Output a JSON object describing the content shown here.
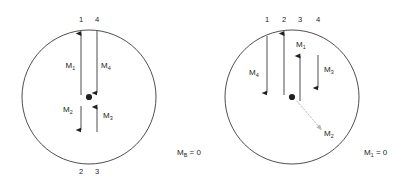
{
  "figure": {
    "background_color": "#ffffff",
    "stroke_color": "#231f20",
    "dim_stroke_color": "#b5b5b5",
    "diagrams": [
      {
        "id": "left-diagram",
        "name": "left-circle-diagram",
        "center": {
          "x": 89,
          "y": 97
        },
        "radius": 67,
        "top_node_numbers": [
          "1",
          "4"
        ],
        "bottom_node_numbers": [
          "2",
          "3"
        ],
        "caption": {
          "symbol": "M",
          "subscript": "B",
          "equals": " = 0",
          "full": "Mʙ = 0"
        },
        "moments": [
          {
            "label": "M",
            "subscript": "1",
            "direction": "up",
            "style": "solid"
          },
          {
            "label": "M",
            "subscript": "4",
            "direction": "down",
            "style": "solid"
          },
          {
            "label": "M",
            "subscript": "2",
            "direction": "down",
            "style": "solid"
          },
          {
            "label": "M",
            "subscript": "3",
            "direction": "up",
            "style": "solid"
          }
        ]
      },
      {
        "id": "right-diagram",
        "name": "right-circle-diagram",
        "center": {
          "x": 292,
          "y": 97
        },
        "radius": 67,
        "top_node_numbers": [
          "1",
          "2",
          "3",
          "4"
        ],
        "bottom_node_numbers": [],
        "caption": {
          "symbol": "M",
          "subscript": "1",
          "equals": " = 0",
          "full": "M₁ = 0"
        },
        "moments": [
          {
            "label": "M",
            "subscript": "4",
            "direction": "down",
            "style": "solid"
          },
          {
            "label": "M",
            "subscript": "1",
            "direction": "up",
            "style": "solid"
          },
          {
            "label": "M",
            "subscript": "3",
            "direction": "down",
            "style": "solid"
          },
          {
            "label": "M",
            "subscript": "2",
            "direction": "diagonal-down-right",
            "style": "dotted"
          }
        ]
      }
    ]
  },
  "left": {
    "num_1": "1",
    "num_4": "4",
    "num_2": "2",
    "num_3": "3",
    "m1": "M",
    "m1_sub": "1",
    "m4": "M",
    "m4_sub": "4",
    "m2": "M",
    "m2_sub": "2",
    "m3": "M",
    "m3_sub": "3",
    "caption_sym": "M",
    "caption_sub": "B",
    "caption_eq": " = 0"
  },
  "right": {
    "num_1": "1",
    "num_2": "2",
    "num_3": "3",
    "num_4": "4",
    "m4": "M",
    "m4_sub": "4",
    "m1": "M",
    "m1_sub": "1",
    "m3": "M",
    "m3_sub": "3",
    "m2": "M",
    "m2_sub": "2",
    "caption_sym": "M",
    "caption_sub": "1",
    "caption_eq": " = 0"
  }
}
